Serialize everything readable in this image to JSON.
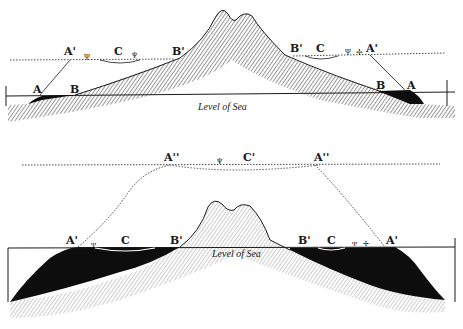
{
  "colors": {
    "ink": "#1a1a1a",
    "paper": "#ffffff",
    "deposit": "#0d0d0d"
  },
  "top_figure": {
    "sea_label": "Level of Sea",
    "labels": {
      "left_A_prime": "A'",
      "left_C": "C",
      "left_B_prime": "B'",
      "left_A": "A",
      "left_B": "B",
      "right_B_prime": "B'",
      "right_C": "C",
      "right_A_prime": "A'",
      "right_B": "B",
      "right_A": "A"
    }
  },
  "bottom_figure": {
    "sea_label": "Level of Sea",
    "labels": {
      "upper_left_A_dprime": "A''",
      "upper_C_prime": "C'",
      "upper_right_A_dprime": "A''",
      "left_A_prime": "A'",
      "left_C": "C",
      "left_B_prime": "B'",
      "right_B_prime": "B'",
      "right_C": "C",
      "right_A_prime": "A'"
    }
  }
}
